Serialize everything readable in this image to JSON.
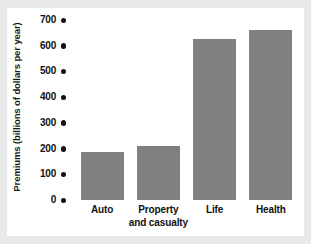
{
  "chart_data": {
    "type": "bar",
    "title": "",
    "subtitle": "",
    "xlabel": "",
    "ylabel": "Premiums (billions of dollars per year)",
    "categories": [
      "Auto",
      "Property and casualty",
      "Life",
      "Health"
    ],
    "category_lines": [
      [
        "Auto"
      ],
      [
        "Property",
        "and casualty"
      ],
      [
        "Life"
      ],
      [
        "Health"
      ]
    ],
    "values": [
      187,
      210,
      628,
      661
    ],
    "ylim": [
      0,
      700
    ],
    "yticks": [
      0,
      100,
      200,
      300,
      400,
      500,
      600,
      700
    ],
    "ytick_labels": [
      "0",
      "100",
      "200",
      "300",
      "400",
      "500",
      "600",
      "700"
    ],
    "grid": false,
    "legend": false,
    "legend_position": "none",
    "bar_color": "#808082",
    "tick_marker_style": "dot",
    "axis_line": false,
    "background_color": "#ffffff",
    "page_border_color": "#e9e9ea",
    "text_color": "#111111"
  }
}
